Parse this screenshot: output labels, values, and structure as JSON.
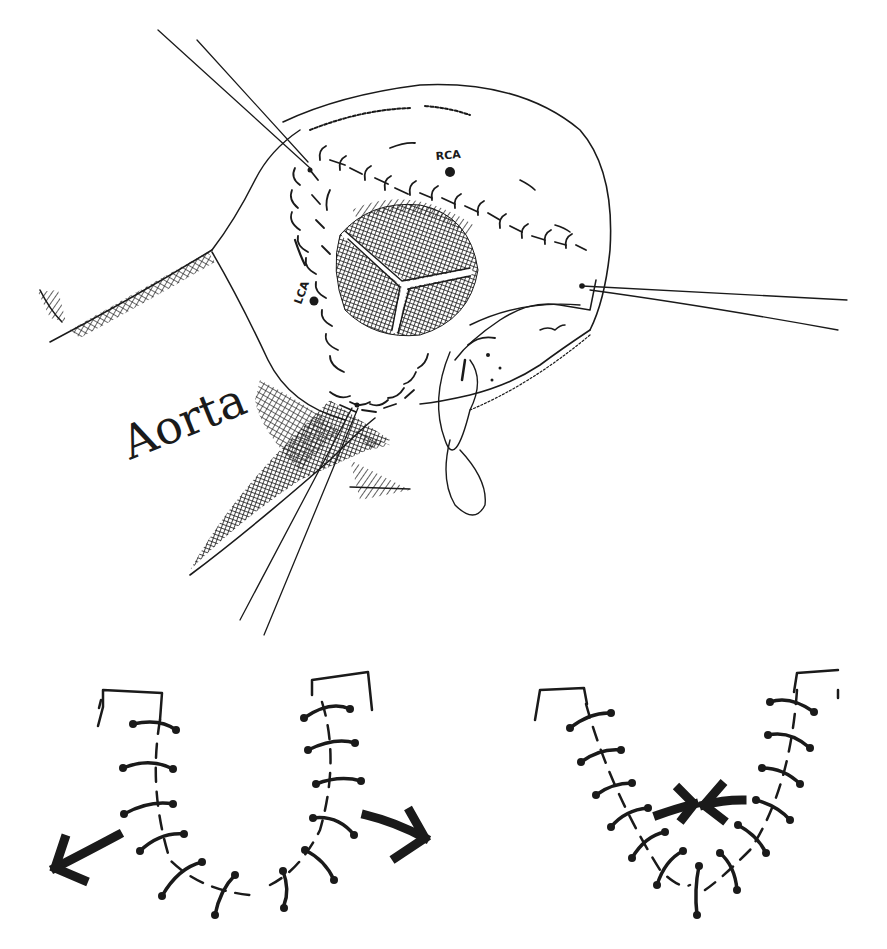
{
  "figure": {
    "type": "surgical-illustration",
    "panels": [
      {
        "id": "main",
        "description": "Opened aortic root with stay sutures and trileaflet valve",
        "labels": {
          "aorta": "Aorta",
          "rca": "RCA",
          "lca": "LCA"
        }
      },
      {
        "id": "lower-left",
        "description": "U-shaped interrupted suture line with diverging arrows",
        "arrow_direction": "outward"
      },
      {
        "id": "lower-right",
        "description": "V-shaped interrupted suture line with converging arrows",
        "arrow_direction": "inward"
      }
    ]
  },
  "colors": {
    "ink": "#1a1a1a",
    "background": "#ffffff"
  }
}
